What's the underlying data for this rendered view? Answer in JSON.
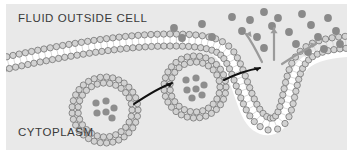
{
  "figure": {
    "type": "biology-diagram",
    "background_color": "#e9e9e9",
    "page_color": "#ffffff"
  },
  "labels": {
    "outside": "FLUID OUTSIDE CELL",
    "inside": "CYTOPLASM",
    "text_color": "#3a3a3a"
  },
  "membrane": {
    "name": "phospholipid-bilayer",
    "head_fill": "#d2d2d2",
    "head_stroke": "#6f6f6f",
    "tail_fill": "#ffffff",
    "core_fill": "#ffffff"
  },
  "vesicles": [
    {
      "name": "free-vesicle",
      "cx": 99,
      "cy": 106,
      "r": 33,
      "cargo_count": 6
    },
    {
      "name": "fusing-vesicle",
      "cx": 189,
      "cy": 83,
      "r": 31,
      "cargo_count": 7
    }
  ],
  "pore": {
    "name": "fused-membrane-pore",
    "x": 268,
    "y": 70
  },
  "cargo": {
    "fill": "#8e8e8e",
    "radius": 3.6
  },
  "particles": {
    "fill": "#8a8a8a",
    "radius": 3.9,
    "points": [
      [
        168,
        24
      ],
      [
        196,
        20
      ],
      [
        176,
        34
      ],
      [
        206,
        33
      ],
      [
        226,
        13
      ],
      [
        236,
        27
      ],
      [
        244,
        16
      ],
      [
        251,
        33
      ],
      [
        258,
        8
      ],
      [
        266,
        22
      ],
      [
        272,
        14
      ],
      [
        283,
        28
      ],
      [
        296,
        10
      ],
      [
        305,
        21
      ],
      [
        290,
        40
      ],
      [
        312,
        33
      ],
      [
        322,
        14
      ],
      [
        330,
        27
      ],
      [
        318,
        45
      ],
      [
        302,
        48
      ],
      [
        334,
        40
      ],
      [
        258,
        44
      ]
    ]
  },
  "release_arrows": {
    "name": "particle-release-arrows",
    "color": "#9b9b9b",
    "count": 3
  },
  "transport_arrows": {
    "name": "vesicle-transport-arrows",
    "color": "#111111",
    "count": 2
  }
}
